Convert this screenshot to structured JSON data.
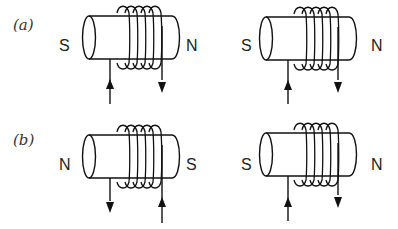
{
  "figure": {
    "rows": [
      {
        "label": "(a)",
        "magnets": [
          {
            "left_pole": "S",
            "right_pole": "N",
            "left_wire_arrow": "up",
            "right_wire_arrow": "down"
          },
          {
            "left_pole": "S",
            "right_pole": "N",
            "left_wire_arrow": "up",
            "right_wire_arrow": "down"
          }
        ]
      },
      {
        "label": "(b)",
        "magnets": [
          {
            "left_pole": "N",
            "right_pole": "S",
            "left_wire_arrow": "down",
            "right_wire_arrow": "up"
          },
          {
            "left_pole": "S",
            "right_pole": "N",
            "left_wire_arrow": "up",
            "right_wire_arrow": "down"
          }
        ]
      }
    ],
    "coil_turns": 5,
    "colors": {
      "line": "#111111",
      "text": "#222222",
      "background": "#ffffff"
    }
  }
}
